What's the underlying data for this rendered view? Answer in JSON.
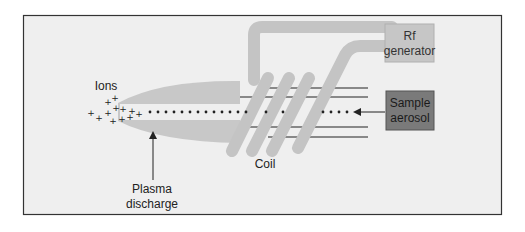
{
  "diagram": {
    "labels": {
      "ions": "Ions",
      "plasma_line1": "Plasma",
      "plasma_line2": "discharge",
      "coil": "Coil",
      "rf_line1": "Rf",
      "rf_line2": "generator",
      "sample_line1": "Sample",
      "sample_line2": "aerosol"
    },
    "colors": {
      "frame_bg": "#efefef",
      "frame_border": "#333333",
      "plasma": "#c8c8c8",
      "coil": "#c4c4c4",
      "rf_box": "#c6c6c6",
      "sample_box": "#7a7a7a",
      "text": "#222222"
    }
  }
}
